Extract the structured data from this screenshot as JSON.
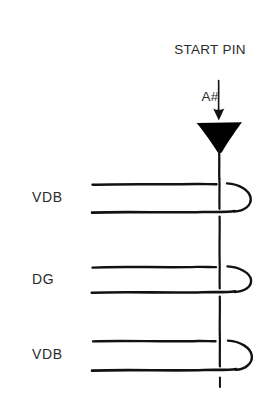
{
  "figure": {
    "type": "hand-drawn-schematic",
    "background_color": "#ffffff",
    "ink_color": "#111111",
    "start_pin": {
      "line1": "START PIN",
      "line2": "A#"
    },
    "arrow": {
      "direction": "down",
      "label": "down-arrow"
    },
    "marker": {
      "shape": "filled-inverted-triangle",
      "fill": "#000000"
    },
    "vertical_line": {
      "label": "vertical-yarn-line",
      "x": 219
    },
    "rows": [
      {
        "label": "VDB",
        "top_line_y": 184,
        "bottom_line_y": 212,
        "loop_side": "right"
      },
      {
        "label": "DG",
        "top_line_y": 267,
        "bottom_line_y": 292,
        "loop_side": "right"
      },
      {
        "label": "VDB",
        "top_line_y": 341,
        "bottom_line_y": 370,
        "loop_side": "right"
      }
    ],
    "line_start_x": 92,
    "loop_right_x": 251
  }
}
